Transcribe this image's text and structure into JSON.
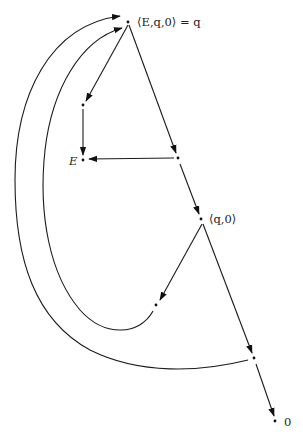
{
  "diagram": {
    "type": "directed-graph",
    "nodes": [
      {
        "id": "top",
        "label": "⟨E,q,0⟩ = q",
        "x": 128,
        "y": 22
      },
      {
        "id": "left",
        "label": "",
        "x": 83,
        "y": 105
      },
      {
        "id": "E",
        "label": "E",
        "x": 83,
        "y": 160
      },
      {
        "id": "mid",
        "label": "",
        "x": 178,
        "y": 158
      },
      {
        "id": "q0",
        "label": "⟨q,0⟩",
        "x": 201,
        "y": 219
      },
      {
        "id": "lowleft",
        "label": "",
        "x": 156,
        "y": 305
      },
      {
        "id": "lowright",
        "label": "",
        "x": 254,
        "y": 358
      },
      {
        "id": "zero",
        "label": "0",
        "x": 275,
        "y": 421
      }
    ],
    "edges": [
      {
        "from": "top",
        "to": "left"
      },
      {
        "from": "top",
        "to": "mid"
      },
      {
        "from": "left",
        "to": "E"
      },
      {
        "from": "mid",
        "to": "E"
      },
      {
        "from": "mid",
        "to": "q0"
      },
      {
        "from": "q0",
        "to": "lowleft"
      },
      {
        "from": "q0",
        "to": "lowright"
      },
      {
        "from": "lowright",
        "to": "zero"
      },
      {
        "from": "lowleft",
        "to": "top",
        "curved": true
      },
      {
        "from": "lowright",
        "to": "top",
        "curved": true
      }
    ]
  },
  "labels": {
    "top": "⟨E,q,0⟩ = q",
    "E": "E",
    "q0": "⟨q,0⟩",
    "zero": "0"
  }
}
